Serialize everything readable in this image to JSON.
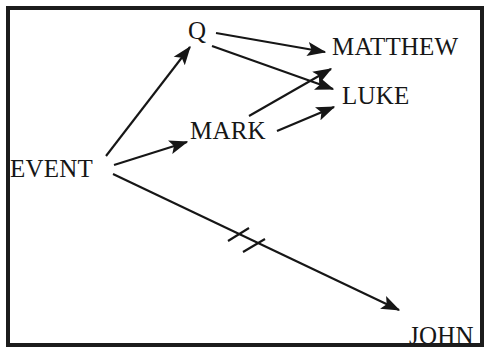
{
  "diagram": {
    "background_color": "#ffffff",
    "border_color": "#1c1c1c",
    "stroke_color": "#161616",
    "nodes": [
      {
        "id": "event",
        "label": "EVENT"
      },
      {
        "id": "q",
        "label": "Q"
      },
      {
        "id": "mark",
        "label": "MARK"
      },
      {
        "id": "matthew",
        "label": "MATTHEW"
      },
      {
        "id": "luke",
        "label": "LUKE"
      },
      {
        "id": "john",
        "label": "JOHN"
      }
    ],
    "edges": [
      {
        "id": "event-to-q",
        "from": "EVENT",
        "to": "Q",
        "style": "arrow"
      },
      {
        "id": "event-to-mark",
        "from": "EVENT",
        "to": "MARK",
        "style": "arrow"
      },
      {
        "id": "event-to-john",
        "from": "EVENT",
        "to": "JOHN",
        "style": "arrow-with-double-hatch"
      },
      {
        "id": "q-to-matthew",
        "from": "Q",
        "to": "MATTHEW",
        "style": "arrow"
      },
      {
        "id": "q-to-luke",
        "from": "Q",
        "to": "LUKE",
        "style": "arrow"
      },
      {
        "id": "mark-to-matthew",
        "from": "MARK",
        "to": "MATTHEW",
        "style": "arrow"
      },
      {
        "id": "mark-to-luke",
        "from": "MARK",
        "to": "LUKE",
        "style": "arrow"
      }
    ],
    "hatch_marks": {
      "count": 2,
      "on_edge": "event-to-john"
    }
  }
}
